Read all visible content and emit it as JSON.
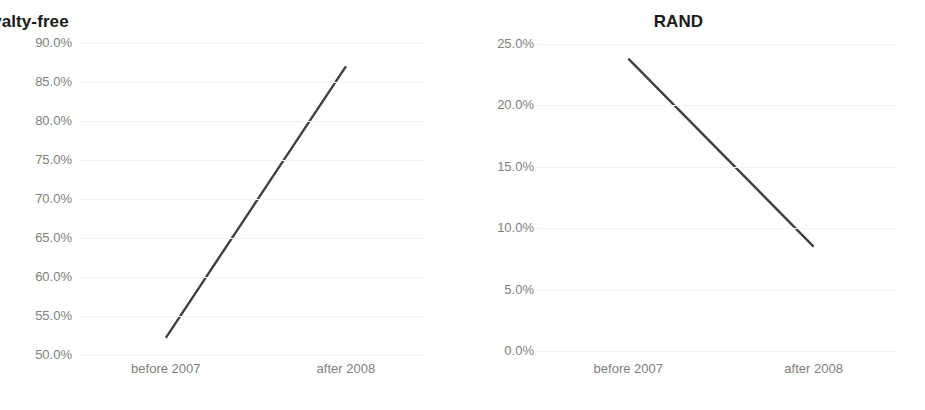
{
  "figure": {
    "background_color": "#ffffff",
    "line_color": "#404040",
    "gridline_color": "#f2f2f2",
    "tick_label_color": "#808080",
    "title_color": "#1a1a1a"
  },
  "panels": [
    {
      "id": "royalty-free",
      "title": "Royalty-free",
      "x_labels": [
        "before 2007",
        "after 2008"
      ],
      "y_labels": [
        "90.0%",
        "85.0%",
        "80.0%",
        "75.0%",
        "70.0%",
        "65.0%",
        "60.0%",
        "55.0%",
        "50.0%"
      ]
    },
    {
      "id": "rand",
      "title": "RAND",
      "x_labels": [
        "before 2007",
        "after 2008"
      ],
      "y_labels": [
        "25.0%",
        "20.0%",
        "15.0%",
        "10.0%",
        "5.0%",
        "0.0%"
      ]
    }
  ],
  "chart_data": [
    {
      "type": "line",
      "title": "Royalty-free",
      "xlabel": "",
      "ylabel": "",
      "categories": [
        "before 2007",
        "after 2008"
      ],
      "values": [
        52.2,
        87.0
      ],
      "value_unit": "%",
      "ylim": [
        50.0,
        90.0
      ],
      "yticks": [
        50.0,
        55.0,
        60.0,
        65.0,
        70.0,
        75.0,
        80.0,
        85.0,
        90.0
      ],
      "ytick_labels": [
        "50.0%",
        "55.0%",
        "60.0%",
        "65.0%",
        "70.0%",
        "75.0%",
        "80.0%",
        "85.0%",
        "90.0%"
      ],
      "grid": true,
      "grid_axis": "y",
      "legend": false,
      "series": [
        {
          "name": "Royalty-free",
          "values": [
            52.2,
            87.0
          ],
          "color": "#404040"
        }
      ]
    },
    {
      "type": "line",
      "title": "RAND",
      "xlabel": "",
      "ylabel": "",
      "categories": [
        "before 2007",
        "after 2008"
      ],
      "values": [
        23.8,
        8.5
      ],
      "value_unit": "%",
      "ylim": [
        0.0,
        25.0
      ],
      "yticks": [
        0.0,
        5.0,
        10.0,
        15.0,
        20.0,
        25.0
      ],
      "ytick_labels": [
        "0.0%",
        "5.0%",
        "10.0%",
        "15.0%",
        "20.0%",
        "25.0%"
      ],
      "grid": true,
      "grid_axis": "y",
      "legend": false,
      "series": [
        {
          "name": "RAND",
          "values": [
            23.8,
            8.5
          ],
          "color": "#404040"
        }
      ]
    }
  ]
}
